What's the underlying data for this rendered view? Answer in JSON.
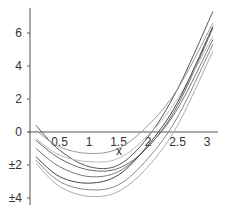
{
  "chart_data": {
    "type": "line",
    "title": "",
    "xlabel": "x",
    "ylabel": "",
    "xlim": [
      0,
      3.15
    ],
    "ylim": [
      -4.1,
      7.5
    ],
    "xticks": [
      "0.5",
      "1",
      "1.5",
      "2",
      "2.5",
      "3"
    ],
    "xtick_values": [
      0.5,
      1,
      1.5,
      2,
      2.5,
      3
    ],
    "yticks": [
      "6",
      "4",
      "2",
      "0",
      "±2",
      "±4"
    ],
    "ytick_values": [
      6,
      4,
      2,
      0,
      -2,
      -4
    ],
    "grid": false,
    "legend": "none",
    "series": [
      {
        "name": "curve-1",
        "color": "#555555",
        "x": [
          0.1,
          0.5,
          1,
          1.5,
          2,
          2.5,
          3.1
        ],
        "y": [
          0.4,
          -1.1,
          -2.1,
          -2.0,
          -0.3,
          2.6,
          7.3
        ]
      },
      {
        "name": "curve-2",
        "color": "#999999",
        "x": [
          0.1,
          0.5,
          1,
          1.5,
          2,
          2.5,
          3.1
        ],
        "y": [
          0.1,
          -0.9,
          -1.3,
          -1.0,
          0.4,
          2.6,
          6.6
        ]
      },
      {
        "name": "curve-3",
        "color": "#666666",
        "x": [
          0.1,
          0.5,
          1,
          1.5,
          2,
          2.5,
          3.1
        ],
        "y": [
          -0.5,
          -1.6,
          -2.3,
          -2.2,
          -0.9,
          1.6,
          6.3
        ]
      },
      {
        "name": "curve-4",
        "color": "#bbbbbb",
        "x": [
          0.1,
          0.5,
          1,
          1.5,
          2,
          2.5,
          3.1
        ],
        "y": [
          -0.4,
          -1.4,
          -1.8,
          -1.6,
          -0.2,
          2.0,
          5.8
        ]
      },
      {
        "name": "curve-5",
        "color": "#777777",
        "x": [
          0.1,
          0.5,
          1,
          1.5,
          2,
          2.5,
          3.1
        ],
        "y": [
          -1.0,
          -2.1,
          -2.7,
          -2.4,
          -0.9,
          1.4,
          5.6
        ]
      },
      {
        "name": "curve-6",
        "color": "#444444",
        "x": [
          0.1,
          0.5,
          1,
          1.5,
          2,
          2.5,
          3.1
        ],
        "y": [
          -1.5,
          -2.7,
          -3.1,
          -2.6,
          -0.8,
          1.8,
          6.4
        ]
      },
      {
        "name": "curve-7",
        "color": "#888888",
        "x": [
          0.1,
          0.5,
          1,
          1.5,
          2,
          2.5,
          3.1
        ],
        "y": [
          -1.7,
          -3.0,
          -3.5,
          -3.2,
          -1.6,
          0.9,
          5.3
        ]
      },
      {
        "name": "curve-8",
        "color": "#aaaaaa",
        "x": [
          0.1,
          0.5,
          1,
          1.5,
          2,
          2.5,
          3.1
        ],
        "y": [
          -1.9,
          -3.3,
          -3.9,
          -3.6,
          -2.1,
          0.4,
          4.9
        ]
      }
    ]
  }
}
